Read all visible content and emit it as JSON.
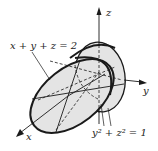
{
  "figure": {
    "labels": {
      "plane": "x + y + z = 2",
      "cylinder": "y² + z² = 1",
      "axis_x": "x",
      "axis_y": "y",
      "axis_z": "z"
    },
    "colors": {
      "fill": "#e4e4e4",
      "stroke": "#1a1a1a",
      "background": "#ffffff"
    }
  }
}
